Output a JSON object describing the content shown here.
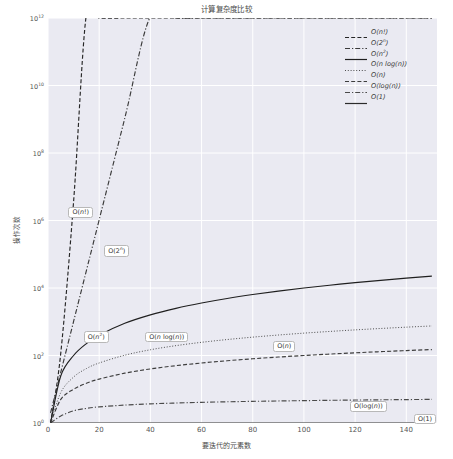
{
  "chart_data": {
    "type": "line",
    "title": "计算复杂度比较",
    "xlabel": "要迭代的元素数",
    "ylabel": "操作次数",
    "yscale": "log",
    "xscale": "linear",
    "xlim": [
      0,
      152
    ],
    "ylim": [
      1,
      1000000000000
    ],
    "grid": true,
    "legend_position": "upper right",
    "xticks": [
      "0",
      "20",
      "40",
      "60",
      "80",
      "100",
      "120",
      "140"
    ],
    "xtick_values": [
      0,
      20,
      40,
      60,
      80,
      100,
      120,
      140
    ],
    "yticks": [
      "10^0",
      "10^2",
      "10^4",
      "10^6",
      "10^8",
      "10^10",
      "10^12"
    ],
    "ytick_values": [
      1,
      100,
      10000,
      1000000,
      100000000,
      10000000000,
      1000000000000
    ],
    "x": [
      1,
      5,
      10,
      15,
      20,
      30,
      40,
      50,
      60,
      70,
      80,
      90,
      100,
      110,
      120,
      130,
      140,
      150
    ],
    "series": [
      {
        "name": "O(n!)",
        "label_html": "O(<i>n</i>!)",
        "linestyle": "dashed",
        "color": "#262626",
        "annotation": "O(n!)",
        "annotation_x": 8,
        "annotation_y": 1800000,
        "values": [
          1,
          120,
          3628800,
          1307674368000,
          1000000000000.0,
          1000000000000.0,
          1000000000000.0,
          1000000000000.0,
          1000000000000.0,
          1000000000000.0,
          1000000000000.0,
          1000000000000.0,
          1000000000000.0,
          1000000000000.0,
          1000000000000.0,
          1000000000000.0,
          1000000000000.0,
          1000000000000.0
        ]
      },
      {
        "name": "O(2^n)",
        "label_html": "O(2<sup>n</sup>)",
        "linestyle": "dashdot",
        "color": "#3a3a3a",
        "annotation": "O(2^n)",
        "annotation_x": 22,
        "annotation_y": 130000,
        "values": [
          2,
          32,
          1024,
          32768,
          1048576,
          1073741824,
          1099511627776,
          1000000000000.0,
          1000000000000.0,
          1000000000000.0,
          1000000000000.0,
          1000000000000.0,
          1000000000000.0,
          1000000000000.0,
          1000000000000.0,
          1000000000000.0,
          1000000000000.0,
          1000000000000.0
        ]
      },
      {
        "name": "O(n^2)",
        "label_html": "O(<i>n</i><sup>2</sup>)",
        "linestyle": "solid",
        "color": "#1f1f1f",
        "annotation": "O(n^2)",
        "annotation_x": 14,
        "annotation_y": 380,
        "values": [
          1,
          25,
          100,
          225,
          400,
          900,
          1600,
          2500,
          3600,
          4900,
          6400,
          8100,
          10000,
          12100,
          14400,
          16900,
          19600,
          22500
        ]
      },
      {
        "name": "O(n log(n))",
        "label_html": "O(<i>n</i> log(<i>n</i>))",
        "linestyle": "dotted",
        "color": "#4d4d4d",
        "annotation": "O(n log(n))",
        "annotation_x": 38,
        "annotation_y": 360,
        "values": [
          1,
          8,
          23,
          41,
          60,
          102,
          148,
          196,
          246,
          297,
          350,
          404,
          460,
          516,
          574,
          632,
          691,
          751
        ]
      },
      {
        "name": "O(n)",
        "label_html": "O(<i>n</i>)",
        "linestyle": "dashed",
        "color": "#3d3d3d",
        "annotation": "O(n)",
        "annotation_x": 88,
        "annotation_y": 190,
        "values": [
          1,
          5,
          10,
          15,
          20,
          30,
          40,
          50,
          60,
          70,
          80,
          90,
          100,
          110,
          120,
          130,
          140,
          150
        ]
      },
      {
        "name": "O(log(n))",
        "label_html": "O(log(<i>n</i>))",
        "linestyle": "dashdot",
        "color": "#4a4a4a",
        "annotation": "O(log(n))",
        "annotation_x": 118,
        "annotation_y": 3.2,
        "values": [
          0.1,
          1.61,
          2.3,
          2.71,
          3.0,
          3.4,
          3.69,
          3.91,
          4.09,
          4.25,
          4.38,
          4.5,
          4.6,
          4.7,
          4.79,
          4.87,
          4.94,
          5.01
        ]
      },
      {
        "name": "O(1)",
        "label_html": "O(1)",
        "linestyle": "solid",
        "color": "#2b2b2b",
        "annotation": "O(1)",
        "annotation_x": 143,
        "annotation_y": 1.35,
        "values": [
          1,
          1,
          1,
          1,
          1,
          1,
          1,
          1,
          1,
          1,
          1,
          1,
          1,
          1,
          1,
          1,
          1,
          1
        ]
      }
    ]
  },
  "colors": {
    "plot_background": "#eaeaf2",
    "grid": "#ffffff",
    "figure_background": "#ffffff",
    "text": "#555555"
  }
}
